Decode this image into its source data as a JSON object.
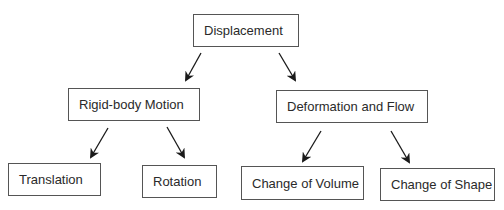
{
  "diagram": {
    "type": "tree",
    "root": "Displacement",
    "nodes": [
      {
        "id": "displacement",
        "label": "Displacement",
        "x": 193,
        "y": 14,
        "w": 106,
        "h": 33
      },
      {
        "id": "rigid",
        "label": "Rigid-body Motion",
        "x": 68,
        "y": 88,
        "w": 132,
        "h": 33
      },
      {
        "id": "deformation",
        "label": "Deformation and Flow",
        "x": 276,
        "y": 90,
        "w": 152,
        "h": 33
      },
      {
        "id": "translation",
        "label": "Translation",
        "x": 8,
        "y": 163,
        "w": 93,
        "h": 33
      },
      {
        "id": "rotation",
        "label": "Rotation",
        "x": 142,
        "y": 165,
        "w": 75,
        "h": 33
      },
      {
        "id": "volume",
        "label": "Change of Volume",
        "x": 241,
        "y": 166,
        "w": 123,
        "h": 34
      },
      {
        "id": "shape",
        "label": "Change of Shape",
        "x": 380,
        "y": 168,
        "w": 115,
        "h": 33
      }
    ],
    "edges": [
      {
        "from": "displacement",
        "to": "rigid"
      },
      {
        "from": "displacement",
        "to": "deformation"
      },
      {
        "from": "rigid",
        "to": "translation"
      },
      {
        "from": "rigid",
        "to": "rotation"
      },
      {
        "from": "deformation",
        "to": "volume"
      },
      {
        "from": "deformation",
        "to": "shape"
      }
    ],
    "colors": {
      "border": "#555555",
      "text": "#2a2a2a",
      "arrow": "#1a1a1a"
    }
  }
}
